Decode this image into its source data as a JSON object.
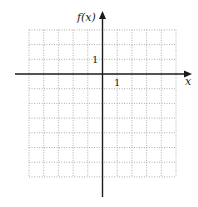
{
  "chart_data": {
    "type": "line",
    "title": "",
    "xlabel": "x",
    "ylabel": "f(x)",
    "xlim": [
      -5,
      5
    ],
    "ylim": [
      -7,
      3
    ],
    "grid": true,
    "grid_style": "dotted",
    "x_tick_label": "1",
    "y_tick_label": "1",
    "series": []
  },
  "labels": {
    "x_axis": "x",
    "y_axis": "f(x)",
    "x_unit": "1",
    "y_unit": "1"
  },
  "colors": {
    "axis": "#1a1a1a",
    "grid": "#9a9a9a",
    "background": "#ffffff"
  }
}
